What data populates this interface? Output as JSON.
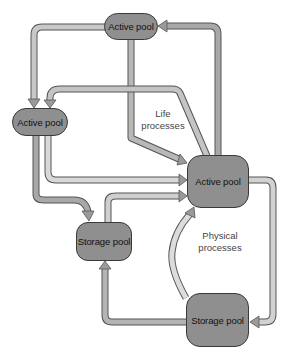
{
  "diagram": {
    "nodes": [
      {
        "id": "active-top",
        "label": "Active pool"
      },
      {
        "id": "active-left",
        "label": "Active pool"
      },
      {
        "id": "active-center",
        "label": "Active pool"
      },
      {
        "id": "storage-left",
        "label": "Storage pool"
      },
      {
        "id": "storage-right",
        "label": "Storage pool"
      }
    ],
    "labels": {
      "life_line1": "Life",
      "life_line2": "processes",
      "physical_line1": "Physical",
      "physical_line2": "processes"
    },
    "edges": [
      {
        "from": "active-top",
        "to": "active-left"
      },
      {
        "from": "active-top",
        "to": "active-center"
      },
      {
        "from": "active-center",
        "to": "active-top"
      },
      {
        "from": "active-center",
        "to": "active-left"
      },
      {
        "from": "active-left",
        "to": "active-center"
      },
      {
        "from": "active-left",
        "to": "storage-left"
      },
      {
        "from": "storage-left",
        "to": "active-center"
      },
      {
        "from": "active-center",
        "to": "storage-right"
      },
      {
        "from": "storage-right",
        "to": "active-center"
      },
      {
        "from": "storage-right",
        "to": "storage-left"
      }
    ],
    "colors": {
      "node_fill": "#8f8f8f",
      "node_border": "#3a3a3a",
      "arrow_dark": "#8a8a8a",
      "arrow_light": "#f2f2f2",
      "arrow_outline": "#555555"
    }
  }
}
